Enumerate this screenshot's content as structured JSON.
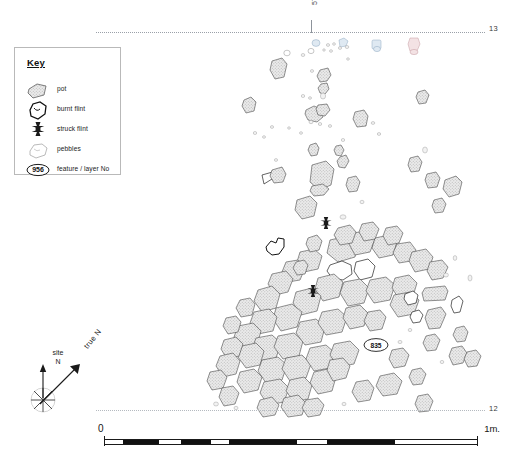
{
  "figure": {
    "type": "archaeological-site-plan"
  },
  "key": {
    "title": "Key",
    "items": [
      {
        "symbol": "pot",
        "label": "pot"
      },
      {
        "symbol": "burnt-flint",
        "label": "burnt flint"
      },
      {
        "symbol": "struck-flint",
        "label": "struck flint"
      },
      {
        "symbol": "pebbles",
        "label": "pebbles"
      },
      {
        "symbol": "feature-number",
        "label": "feature / layer No",
        "example_number": "956"
      }
    ]
  },
  "grid": {
    "top_tick_label": "57",
    "top_right_label": "13",
    "bottom_right_label": "12"
  },
  "features": {
    "labels": [
      {
        "number": "835"
      }
    ]
  },
  "north": {
    "site_line_1": "site",
    "site_line_2": "N",
    "true_label": "true N"
  },
  "scale": {
    "min_label": "0",
    "max_label": "1m.",
    "units": "m",
    "total_length": 1
  },
  "colors": {
    "stone_outline": "#3b3b3b",
    "stipple_fill": "#c9c9c9",
    "grid_line": "#9aa0a8",
    "ink": "#1a1a1a",
    "faint_blue": "#dfe9f2",
    "faint_pink": "#f3e2e4"
  }
}
